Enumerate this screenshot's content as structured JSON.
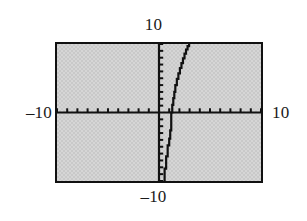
{
  "figure": {
    "kind": "graphing-calculator-window",
    "frame": {
      "border_color": "#111111",
      "fill_color": "#c9c9c9"
    },
    "labels": {
      "top": "10",
      "bottom": "–10",
      "left": "–10",
      "right": "10"
    }
  },
  "chart_data": {
    "type": "line",
    "title": "",
    "xlabel": "",
    "ylabel": "",
    "xlim": [
      -10,
      10
    ],
    "ylim": [
      -10,
      10
    ],
    "grid": false,
    "legend": null,
    "axes": {
      "x_axis_at_y": 0,
      "y_axis_at_x": 0,
      "x_tick_interval": 1,
      "y_tick_interval": 1,
      "tick_labels_shown": false,
      "range_labels": {
        "xmin": "–10",
        "xmax": "10",
        "ymin": "–10",
        "ymax": "10"
      }
    },
    "series": [
      {
        "name": "curve",
        "shape": "increasing cubic through x-intercept near x = 1.3",
        "color": "#111111",
        "x_intercept": 1.3,
        "x": [
          0.55,
          0.7,
          0.85,
          1.0,
          1.1,
          1.2,
          1.3,
          1.4,
          1.5,
          1.6,
          1.75,
          1.9,
          2.05,
          2.2,
          2.35,
          2.5,
          2.65,
          2.8,
          2.95,
          3.05
        ],
        "y": [
          -10.0,
          -8.2,
          -6.4,
          -4.8,
          -3.8,
          -2.6,
          0.0,
          1.1,
          2.1,
          3.0,
          4.0,
          4.9,
          5.7,
          6.5,
          7.2,
          7.9,
          8.6,
          9.2,
          9.7,
          10.0
        ]
      }
    ]
  }
}
